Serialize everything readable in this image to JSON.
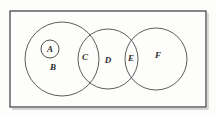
{
  "figure": {
    "type": "venn-diagram",
    "background_color": "#fdfdfc",
    "stroke_color": "#4a4a4a",
    "label_color": "#2b2b2b",
    "universe": {
      "name": "universal-set-rectangle",
      "x": 10,
      "y": 11,
      "width": 196,
      "height": 96
    },
    "regions": [
      {
        "id": "A",
        "label": "A",
        "shape": "circle",
        "cx": 50,
        "cy": 49,
        "r": 9,
        "label_x": 50,
        "label_y": 49,
        "contained_in": "B"
      },
      {
        "id": "B",
        "label": "B",
        "shape": "circle",
        "cx": 62,
        "cy": 59,
        "r": 37,
        "label_x": 53,
        "label_y": 67,
        "contained_in": null
      },
      {
        "id": "C",
        "label": "C",
        "shape": "lens-intersection",
        "label_x": 85,
        "label_y": 57,
        "intersection_of": [
          "B",
          "D"
        ]
      },
      {
        "id": "D",
        "label": "D",
        "shape": "circle",
        "cx": 108,
        "cy": 59,
        "r": 30,
        "label_x": 108,
        "label_y": 60,
        "contained_in": null
      },
      {
        "id": "E",
        "label": "E",
        "shape": "lens-intersection",
        "label_x": 131,
        "label_y": 58,
        "intersection_of": [
          "D",
          "F"
        ]
      },
      {
        "id": "F",
        "label": "F",
        "shape": "circle",
        "cx": 156,
        "cy": 59,
        "r": 31,
        "label_x": 158,
        "label_y": 55,
        "contained_in": null
      }
    ]
  }
}
